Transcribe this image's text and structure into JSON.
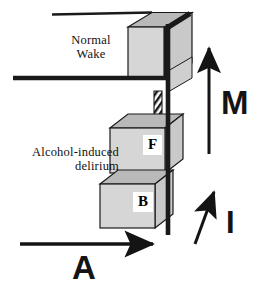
{
  "figure": {
    "width": 261,
    "height": 288,
    "background": "#ffffff"
  },
  "labels": {
    "normal_wake": "Normal\nWake",
    "alcohol_delirium": "Alcohol-induced\ndelirium"
  },
  "boxes": [
    {
      "id": "top",
      "label": "",
      "name": "normal-wake-box"
    },
    {
      "id": "middle",
      "label": "F",
      "name": "f-box"
    },
    {
      "id": "bottom",
      "label": "B",
      "name": "b-box"
    }
  ],
  "vectors": [
    {
      "id": "M",
      "label": "M",
      "direction": "up",
      "name": "m-vector"
    },
    {
      "id": "I",
      "label": "I",
      "direction": "up-left",
      "name": "i-vector"
    },
    {
      "id": "A",
      "label": "A",
      "direction": "right",
      "name": "a-vector"
    },
    {
      "id": "hatched",
      "label": "",
      "direction": "down",
      "name": "hatched-down-arrow"
    }
  ],
  "colors": {
    "stroke": "#1a1a1a",
    "box_top_face": "#b9b9b9",
    "box_front_face": "#d6d6d6",
    "box_side_face": "#c9c9c9",
    "label_patch": "#ffffff",
    "text": "#111111"
  }
}
